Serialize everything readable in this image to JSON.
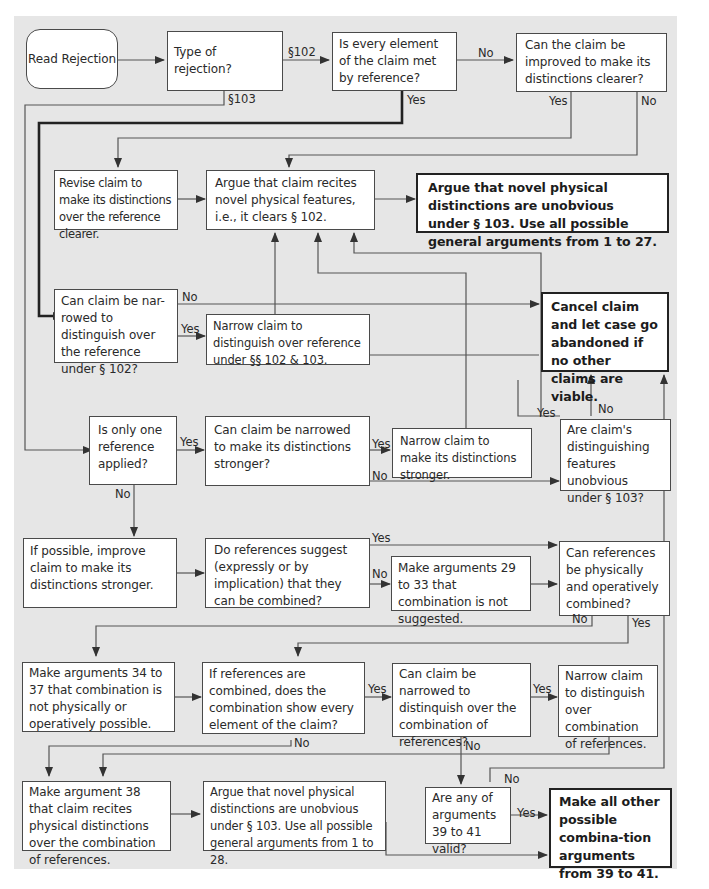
{
  "nodes": {
    "read_rejection": "Read Rejection",
    "type_of_rejection": "Type of rejection?",
    "every_element_met": "Is every element of the claim met by reference?",
    "can_improve_clearer": "Can the claim be improved to make its distinctions clearer?",
    "revise_claim": "Revise claim to make its distinctions over the reference clearer.",
    "argue_novel_features": "Argue that claim recites novel physical features, i.e., it clears § 102.",
    "argue_unobvious_103": "Argue that novel physical distinctions are unobvious under § 103. Use all possible general arguments from 1 to 27.",
    "can_narrow_102": "Can claim be nar-rowed to distinguish over the reference under § 102?",
    "narrow_102_103": "Narrow claim to distinguish over reference under §§ 102 & 103.",
    "cancel_claim": "Cancel claim and let case go abandoned if no other claims are viable.",
    "only_one_reference": "Is only one reference applied?",
    "can_narrow_stronger": "Can claim be narrowed to make its distinctions stronger?",
    "narrow_stronger": "Narrow claim to  make its distinctions stronger.",
    "features_unobvious": "Are claim's distinguishing features unobvious under § 103?",
    "improve_claim_stronger": "If possible, improve claim to make its distinctions stronger.",
    "refs_suggest_combined": "Do references suggest (expressly or by implication) that they can be combined?",
    "args_29_33": "Make arguments 29 to 33 that combination is not suggested.",
    "refs_physically_combined": "Can references be physically and operatively combined?",
    "args_34_37": "Make arguments 34 to 37 that combination is not physically or operatively possible.",
    "combination_shows_every": "If references are combined, does the combination show every element of the claim?",
    "narrow_over_combination_q": "Can claim be narrowed to distinquish over the combination of references?",
    "narrow_over_combination": "Narrow claim to distinguish over combination of references.",
    "arg_38": "Make argument 38 that claim recites physical distinctions over the combination of references.",
    "argue_unobvious_1_28": "Argue that novel physical distinctions are unobvious under § 103. Use all possible general arguments from 1 to 28.",
    "args_39_41_valid": "Are any of arguments 39 to 41 valid?",
    "make_combination_args": "Make all other possible combina-tion arguments from 39 to 41."
  },
  "edge_labels": {
    "s102": "§102",
    "s103": "§103",
    "every_no": "No",
    "every_yes": "Yes",
    "clearer_yes": "Yes",
    "clearer_no": "No",
    "narrow102_no": "No",
    "narrow102_yes": "Yes",
    "onlyone_yes": "Yes",
    "onlyone_no": "No",
    "stronger_yes": "Yes",
    "stronger_no": "No",
    "unobv_yes": "Yes",
    "unobv_no": "No",
    "suggest_yes": "Yes",
    "suggest_no": "No",
    "physical_no": "No",
    "physical_yes": "Yes",
    "showevery_yes": "Yes",
    "showevery_no": "No",
    "narrowcomb_yes": "Yes",
    "narrowcomb_no": "No",
    "valid_yes": "Yes",
    "valid_no": "No"
  },
  "colors": {
    "panel": "#e6e6e6",
    "box": "#ffffff",
    "line": "#4a4a4a",
    "text": "#2a2a2a"
  }
}
